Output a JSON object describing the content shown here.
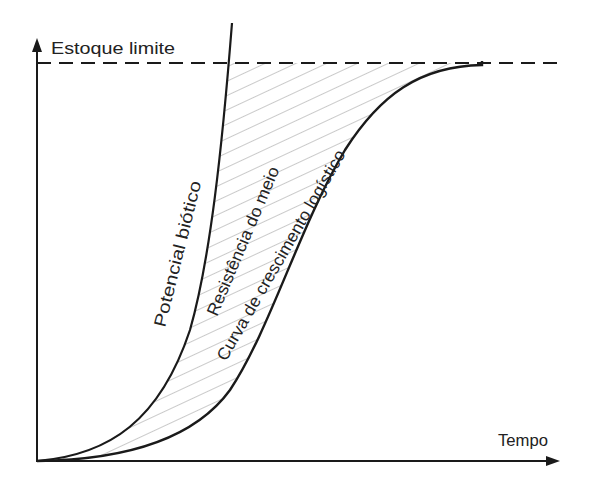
{
  "diagram": {
    "type": "population-growth-curves",
    "y_axis_label": "Estoque limite",
    "x_axis_label": "Tempo",
    "curves": [
      {
        "id": "biotic",
        "label": "Potencial biótico"
      },
      {
        "id": "resistance",
        "label": "Resistência do meio"
      },
      {
        "id": "logistic",
        "label": "Curva de crescimento logístico"
      }
    ],
    "carrying_capacity_line": "dashed",
    "colors": {
      "line": "#1a1a1a",
      "hatch": "#8a8a8a",
      "background": "#ffffff"
    }
  }
}
